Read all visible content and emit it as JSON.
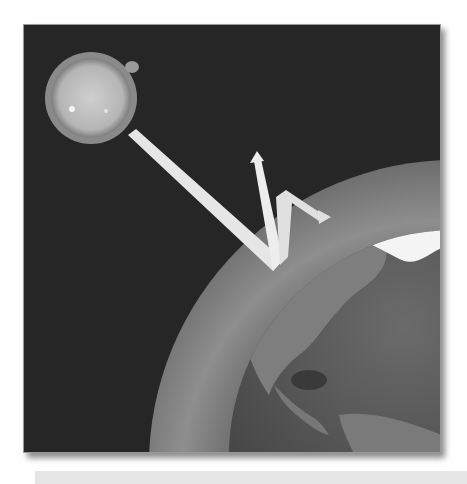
{
  "illustration": {
    "subject": "Solar radiation entering Earth's atmosphere, partly reflected and re-emitted",
    "elements": {
      "sun": "sun",
      "atmosphere": "atmosphere-layer",
      "earth": "earth-globe",
      "incoming_ray": "incoming-solar-radiation-arrow",
      "reflected_ray_up": "reflected-radiation-arrow",
      "reflected_ray_side": "scattered-radiation-arrow"
    },
    "colors": {
      "space": "#262626",
      "sun_fill": "#bdbdbd",
      "sun_rim": "#8a8a8a",
      "arrow": "#e8e8e8",
      "atmosphere": "#8c8c8c",
      "earth_ocean": "#4a4a4a",
      "earth_land": "#7a7a7a",
      "ice": "#f5f5f5"
    }
  },
  "caption_bar": {
    "text": ""
  }
}
